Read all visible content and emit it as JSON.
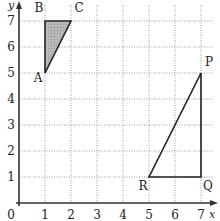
{
  "diagram": {
    "type": "coordinate-grid",
    "axes": {
      "x_label": "x",
      "y_label": "y",
      "origin_label": "0",
      "x_ticks": [
        "1",
        "2",
        "3",
        "4",
        "5",
        "6",
        "7"
      ],
      "y_ticks": [
        "1",
        "2",
        "3",
        "4",
        "5",
        "6",
        "7"
      ]
    },
    "shapes": [
      {
        "name": "ABC",
        "shaded": true,
        "fill": "#b8b8b8",
        "vertices": [
          {
            "label": "A",
            "x": 1,
            "y": 5
          },
          {
            "label": "B",
            "x": 1,
            "y": 7
          },
          {
            "label": "C",
            "x": 2,
            "y": 7
          }
        ]
      },
      {
        "name": "PQR",
        "shaded": false,
        "vertices": [
          {
            "label": "P",
            "x": 7,
            "y": 5
          },
          {
            "label": "Q",
            "x": 7,
            "y": 1
          },
          {
            "label": "R",
            "x": 5,
            "y": 1
          }
        ]
      }
    ],
    "colors": {
      "grid": "#9a9a9a",
      "axis": "#333333",
      "shape_outline": "#222222",
      "shade": "#b8b8b8"
    }
  }
}
